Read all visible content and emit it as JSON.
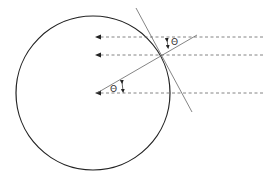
{
  "diagram": {
    "circle": {
      "cx": 93,
      "cy": 93,
      "r": 77,
      "stroke": "#222222"
    },
    "rays": [
      {
        "y": 37,
        "x1": 263,
        "x2": 97
      },
      {
        "y": 55,
        "x1": 263,
        "x2": 97
      },
      {
        "y": 93,
        "x1": 263,
        "x2": 97
      }
    ],
    "tangent_line": {
      "x1": 136,
      "y1": 8,
      "x2": 192,
      "y2": 112
    },
    "normal_line": {
      "x1": 97,
      "y1": 93,
      "x2": 197,
      "y2": 35
    },
    "angle_labels": [
      {
        "text": "Θ",
        "x": 175,
        "y": 44
      },
      {
        "text": "Θ",
        "x": 113,
        "y": 91
      }
    ],
    "colors": {
      "line": "#555555",
      "dash": "#666666",
      "circle": "#222222"
    }
  }
}
